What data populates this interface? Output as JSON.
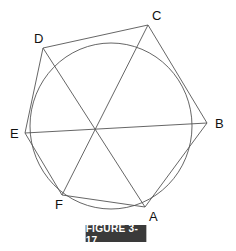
{
  "figure": {
    "caption": "FIGURE 3-17",
    "caption_bg": "#3a3a3a",
    "caption_fg": "#ffffff",
    "stroke_color": "#555555",
    "center": {
      "x": 96,
      "y": 129
    },
    "circle": {
      "cx": 111,
      "cy": 126,
      "rx": 81,
      "ry": 83
    },
    "vertices": [
      {
        "name": "A",
        "x": 145,
        "y": 207,
        "label_x": 149,
        "label_y": 221
      },
      {
        "name": "B",
        "x": 207,
        "y": 123,
        "label_x": 215,
        "label_y": 128
      },
      {
        "name": "C",
        "x": 148,
        "y": 25,
        "label_x": 152,
        "label_y": 20
      },
      {
        "name": "D",
        "x": 43,
        "y": 48,
        "label_x": 34,
        "label_y": 43
      },
      {
        "name": "E",
        "x": 25,
        "y": 133,
        "label_x": 10,
        "label_y": 138
      },
      {
        "name": "F",
        "x": 62,
        "y": 195,
        "label_x": 55,
        "label_y": 209
      }
    ],
    "diagonals": [
      [
        "A",
        "D"
      ],
      [
        "B",
        "E"
      ],
      [
        "C",
        "F"
      ]
    ]
  }
}
